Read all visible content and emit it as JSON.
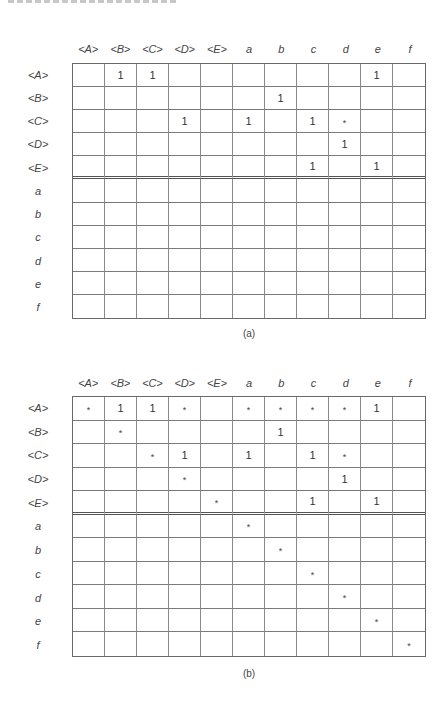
{
  "columns": [
    "<A>",
    "<B>",
    "<C>",
    "<D>",
    "<E>",
    "a",
    "b",
    "c",
    "d",
    "e",
    "f"
  ],
  "rows": [
    "<A>",
    "<B>",
    "<C>",
    "<D>",
    "<E>",
    "a",
    "b",
    "c",
    "d",
    "e",
    "f"
  ],
  "divider_after_row": 4,
  "figures": [
    {
      "caption": "(a)",
      "matrix": [
        [
          "",
          "1",
          "1",
          "",
          "",
          "",
          "",
          "",
          "",
          "1",
          ""
        ],
        [
          "",
          "",
          "",
          "",
          "",
          "",
          "1",
          "",
          "",
          "",
          ""
        ],
        [
          "",
          "",
          "",
          "1",
          "",
          "1",
          "",
          "1",
          "*",
          "",
          ""
        ],
        [
          "",
          "",
          "",
          "",
          "",
          "",
          "",
          "",
          "1",
          "",
          ""
        ],
        [
          "",
          "",
          "",
          "",
          "",
          "",
          "",
          "1",
          "",
          "1",
          ""
        ],
        [
          "",
          "",
          "",
          "",
          "",
          "",
          "",
          "",
          "",
          "",
          ""
        ],
        [
          "",
          "",
          "",
          "",
          "",
          "",
          "",
          "",
          "",
          "",
          ""
        ],
        [
          "",
          "",
          "",
          "",
          "",
          "",
          "",
          "",
          "",
          "",
          ""
        ],
        [
          "",
          "",
          "",
          "",
          "",
          "",
          "",
          "",
          "",
          "",
          ""
        ],
        [
          "",
          "",
          "",
          "",
          "",
          "",
          "",
          "",
          "",
          "",
          ""
        ],
        [
          "",
          "",
          "",
          "",
          "",
          "",
          "",
          "",
          "",
          "",
          ""
        ]
      ]
    },
    {
      "caption": "(b)",
      "matrix": [
        [
          "*",
          "1",
          "1",
          "*",
          "",
          "*",
          "*",
          "*",
          "*",
          "1",
          ""
        ],
        [
          "",
          "*",
          "",
          "",
          "",
          "",
          "1",
          "",
          "",
          "",
          ""
        ],
        [
          "",
          "",
          "*",
          "1",
          "",
          "1",
          "",
          "1",
          "*",
          "",
          ""
        ],
        [
          "",
          "",
          "",
          "*",
          "",
          "",
          "",
          "",
          "1",
          "",
          ""
        ],
        [
          "",
          "",
          "",
          "",
          "*",
          "",
          "",
          "1",
          "",
          "1",
          ""
        ],
        [
          "",
          "",
          "",
          "",
          "",
          "*",
          "",
          "",
          "",
          "",
          ""
        ],
        [
          "",
          "",
          "",
          "",
          "",
          "",
          "*",
          "",
          "",
          "",
          ""
        ],
        [
          "",
          "",
          "",
          "",
          "",
          "",
          "",
          "*",
          "",
          "",
          ""
        ],
        [
          "",
          "",
          "",
          "",
          "",
          "",
          "",
          "",
          "*",
          "",
          ""
        ],
        [
          "",
          "",
          "",
          "",
          "",
          "",
          "",
          "",
          "",
          "*",
          ""
        ],
        [
          "",
          "",
          "",
          "",
          "",
          "",
          "",
          "",
          "",
          "",
          "*"
        ]
      ]
    }
  ]
}
